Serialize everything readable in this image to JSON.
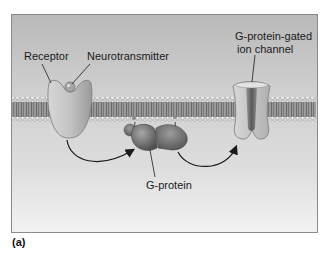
{
  "figure": {
    "panel_label": "(a)",
    "labels": {
      "receptor": "Receptor",
      "neurotransmitter": "Neurotransmitter",
      "ion_channel_line1": "G-protein-gated",
      "ion_channel_line2": "ion channel",
      "g_protein": "G-protein"
    },
    "colors": {
      "background_top": "#b9b9b9",
      "background_bottom": "#f2f2f2",
      "frame_border": "#8a8a8a",
      "membrane_head": "#e8e8e8",
      "membrane_tail": "#7a7a7a",
      "protein_light": "#bdbdbd",
      "protein_dark": "#6e6e6e",
      "arrow": "#1a1a1a"
    }
  }
}
